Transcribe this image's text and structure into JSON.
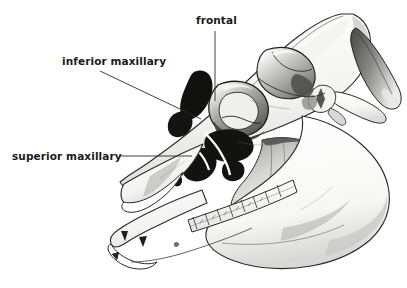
{
  "figure": {
    "kind": "anatomical-illustration",
    "width": 407,
    "height": 288,
    "background_color": "#ffffff",
    "ink_color": "#1a1a1a",
    "leader_line_color": "#2b2b2b"
  },
  "labels": [
    {
      "id": "frontal",
      "text": "frontal",
      "text_x": 196,
      "text_y": 14,
      "leader": {
        "type": "vertical",
        "x1": 215,
        "y1": 31,
        "x2": 215,
        "y2": 101
      }
    },
    {
      "id": "inferior-maxillary",
      "text": "inferior maxillary",
      "text_x": 62,
      "text_y": 55,
      "leader": {
        "type": "diagonal",
        "x1": 100,
        "y1": 71,
        "x2": 201,
        "y2": 119
      }
    },
    {
      "id": "superior-maxillary",
      "text": "superior maxillary",
      "text_x": 12,
      "text_y": 150,
      "leader": {
        "type": "horizontal",
        "x1": 120,
        "y1": 156,
        "x2": 192,
        "y2": 156
      }
    }
  ]
}
